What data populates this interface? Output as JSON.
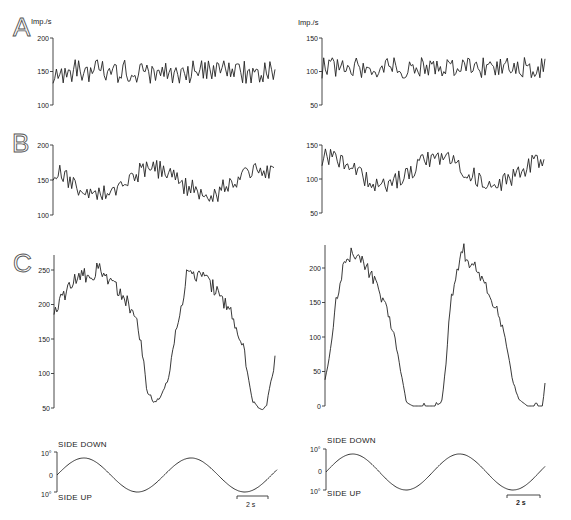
{
  "chart_data": [
    {
      "id": "A-left",
      "type": "line",
      "panel_label": "A",
      "ylabel": "Imp./s",
      "yticks": [
        "100",
        "150",
        "200"
      ],
      "ylim": [
        100,
        200
      ],
      "description": "Noisy discharge fluctuating around ~150 imp/s with no modulation",
      "mean": 150,
      "noise_amplitude": 18,
      "modulation_amplitude": 0,
      "n_samples": 130
    },
    {
      "id": "A-right",
      "type": "line",
      "panel_label": "",
      "ylabel": "Imp./s",
      "yticks": [
        "50",
        "100",
        "150"
      ],
      "ylim": [
        50,
        150
      ],
      "description": "Noisy discharge fluctuating around ~105 imp/s with no modulation",
      "mean": 105,
      "noise_amplitude": 16,
      "modulation_amplitude": 0,
      "n_samples": 130
    },
    {
      "id": "B-left",
      "type": "line",
      "panel_label": "B",
      "ylabel": "",
      "yticks": [
        "100",
        "150",
        "200"
      ],
      "ylim": [
        100,
        200
      ],
      "description": "Noisy discharge ~148 imp/s with weak sinusoidal modulation",
      "mean": 148,
      "noise_amplitude": 14,
      "modulation_amplitude": 18,
      "n_samples": 130
    },
    {
      "id": "B-right",
      "type": "line",
      "panel_label": "",
      "ylabel": "",
      "yticks": [
        "50",
        "100",
        "150"
      ],
      "ylim": [
        50,
        150
      ],
      "description": "Noisy discharge ~112 imp/s with weak sinusoidal modulation",
      "mean": 112,
      "noise_amplitude": 13,
      "modulation_amplitude": 20,
      "n_samples": 130
    },
    {
      "id": "C-left",
      "type": "line",
      "panel_label": "C",
      "ylabel": "",
      "yticks": [
        "50",
        "100",
        "150",
        "200",
        "250"
      ],
      "ylim": [
        40,
        275
      ],
      "description": "Strong modulation between ~55 and ~255 imp/s over two cycles",
      "x": [
        0,
        0.02,
        0.05,
        0.1,
        0.15,
        0.2,
        0.25,
        0.3,
        0.33,
        0.36,
        0.38,
        0.4,
        0.42,
        0.45,
        0.48,
        0.5,
        0.52,
        0.55,
        0.58,
        0.6,
        0.65,
        0.7,
        0.75,
        0.8,
        0.83,
        0.86,
        0.88,
        0.9,
        0.93,
        0.96,
        1.0
      ],
      "y": [
        195,
        200,
        215,
        235,
        245,
        250,
        235,
        220,
        205,
        185,
        170,
        130,
        75,
        60,
        65,
        78,
        95,
        160,
        200,
        245,
        245,
        235,
        210,
        195,
        160,
        135,
        90,
        60,
        48,
        52,
        120
      ]
    },
    {
      "id": "C-right",
      "type": "line",
      "panel_label": "",
      "ylabel": "",
      "yticks": [
        "0",
        "50",
        "100",
        "150",
        "200"
      ],
      "ylim": [
        0,
        225
      ],
      "description": "Strong modulation between 0 and ~225 imp/s over two cycles, silent at troughs",
      "x": [
        0,
        0.02,
        0.05,
        0.08,
        0.1,
        0.13,
        0.17,
        0.2,
        0.24,
        0.28,
        0.32,
        0.35,
        0.37,
        0.4,
        0.45,
        0.5,
        0.53,
        0.55,
        0.57,
        0.6,
        0.63,
        0.66,
        0.7,
        0.74,
        0.78,
        0.82,
        0.85,
        0.88,
        0.92,
        0.97,
        0.99,
        1.0
      ],
      "y": [
        40,
        70,
        150,
        200,
        215,
        225,
        215,
        195,
        170,
        140,
        95,
        40,
        5,
        0,
        0,
        0,
        5,
        60,
        150,
        195,
        225,
        205,
        195,
        165,
        140,
        100,
        40,
        10,
        0,
        0,
        0,
        35
      ]
    },
    {
      "id": "stimulus-left",
      "type": "line",
      "description": "Sinusoidal tilt stimulus, ±10°, ~2 cycles",
      "ylabels": {
        "top": "10°",
        "mid": "0",
        "bottom": "10°"
      },
      "annotations": {
        "top": "SIDE DOWN",
        "bottom": "SIDE UP"
      },
      "amplitude_deg": 8,
      "cycles": 2.05,
      "scale_bar": "2 s"
    },
    {
      "id": "stimulus-right",
      "type": "line",
      "description": "Sinusoidal tilt stimulus, ±10°, ~2 cycles",
      "ylabels": {
        "top": "10°",
        "mid": "0",
        "bottom": "10°"
      },
      "annotations": {
        "top": "SIDE DOWN",
        "bottom": "SIDE UP"
      },
      "amplitude_deg": 8,
      "cycles": 2.05,
      "scale_bar": "2 s"
    }
  ],
  "labels": {
    "A": "A",
    "B": "B",
    "C": "C",
    "unit": "Imp./s",
    "side_down": "SIDE DOWN",
    "side_up": "SIDE UP",
    "deg10": "10°",
    "zero": "0",
    "scale": "2 s"
  }
}
